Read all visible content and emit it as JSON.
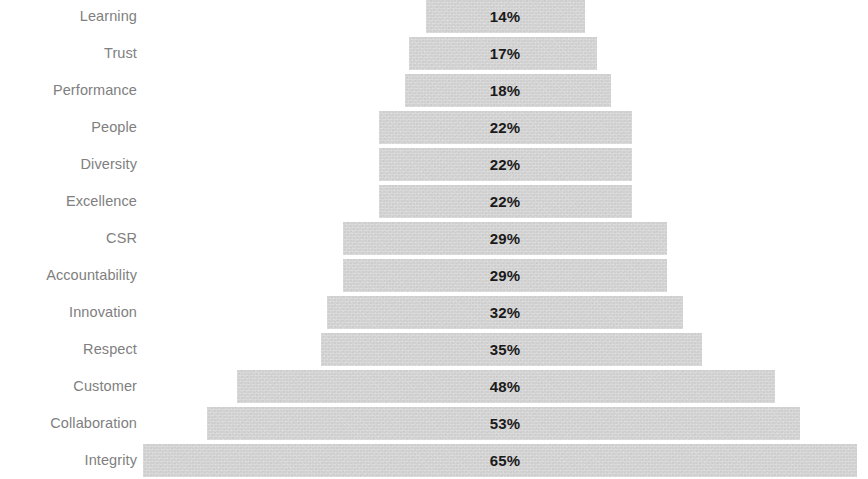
{
  "chart_data": {
    "type": "bar",
    "title": "",
    "subtitle": "",
    "xlabel": "",
    "ylabel": "",
    "orientation": "horizontal",
    "shape": "pyramid",
    "grid": false,
    "legend": false,
    "axis_visible": false,
    "value_suffix": "%",
    "xlim": [
      0,
      65
    ],
    "categories": [
      "Learning",
      "Trust",
      "Performance",
      "People",
      "Diversity",
      "Excellence",
      "CSR",
      "Accountability",
      "Innovation",
      "Respect",
      "Customer",
      "Collaboration",
      "Integrity"
    ],
    "values": [
      14,
      17,
      18,
      22,
      22,
      22,
      29,
      29,
      32,
      35,
      48,
      53,
      65
    ],
    "value_labels": [
      "14%",
      "17%",
      "18%",
      "22%",
      "22%",
      "22%",
      "29%",
      "29%",
      "32%",
      "35%",
      "48%",
      "53%",
      "65%"
    ],
    "colors": {
      "bar_fill": "#d2d2d2",
      "category_label": "#808080",
      "value_label": "#1a1a1a",
      "background": "#ffffff"
    }
  },
  "rows": [
    {
      "label": "Learning",
      "value": "14%",
      "bar_left": 426,
      "bar_width": 159,
      "top": 0
    },
    {
      "label": "Trust",
      "value": "17%",
      "bar_left": 409,
      "bar_width": 188,
      "top": 37
    },
    {
      "label": "Performance",
      "value": "18%",
      "bar_left": 405,
      "bar_width": 206,
      "top": 74
    },
    {
      "label": "People",
      "value": "22%",
      "bar_left": 379,
      "bar_width": 253,
      "top": 111
    },
    {
      "label": "Diversity",
      "value": "22%",
      "bar_left": 379,
      "bar_width": 253,
      "top": 148
    },
    {
      "label": "Excellence",
      "value": "22%",
      "bar_left": 379,
      "bar_width": 253,
      "top": 185
    },
    {
      "label": "CSR",
      "value": "29%",
      "bar_left": 343,
      "bar_width": 324,
      "top": 222
    },
    {
      "label": "Accountability",
      "value": "29%",
      "bar_left": 343,
      "bar_width": 324,
      "top": 259
    },
    {
      "label": "Innovation",
      "value": "32%",
      "bar_left": 327,
      "bar_width": 356,
      "top": 296
    },
    {
      "label": "Respect",
      "value": "35%",
      "bar_left": 321,
      "bar_width": 381,
      "top": 333
    },
    {
      "label": "Customer",
      "value": "48%",
      "bar_left": 237,
      "bar_width": 538,
      "top": 370
    },
    {
      "label": "Collaboration",
      "value": "53%",
      "bar_left": 207,
      "bar_width": 593,
      "top": 407
    },
    {
      "label": "Integrity",
      "value": "65%",
      "bar_left": 143,
      "bar_width": 714,
      "top": 444
    }
  ]
}
